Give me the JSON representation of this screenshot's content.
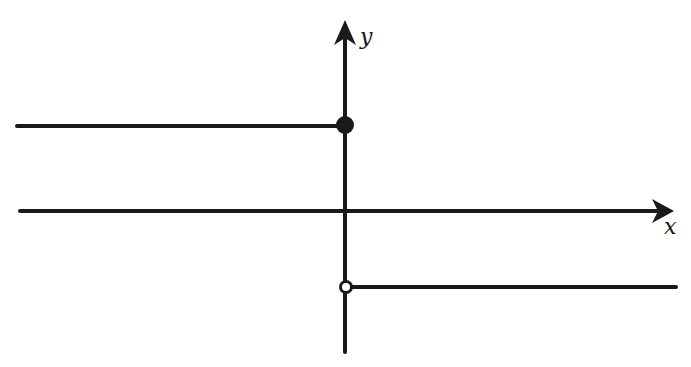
{
  "diagram": {
    "type": "step-function-graph",
    "colors": {
      "ink": "#1a1a1a",
      "background": "#ffffff"
    },
    "axes": {
      "x": {
        "label": "x",
        "y_px": 211,
        "from_px": 20,
        "to_px": 670
      },
      "y": {
        "label": "y",
        "x_px": 345,
        "from_px": 352,
        "to_px": 22
      }
    },
    "segments": [
      {
        "name": "upper-ray",
        "description": "horizontal ray to the left at positive y",
        "x1": 17,
        "y1": 126,
        "x2": 345,
        "y2": 126
      },
      {
        "name": "lower-ray",
        "description": "horizontal ray to the right at negative y",
        "x1": 345,
        "y1": 287,
        "x2": 676,
        "y2": 287
      }
    ],
    "points": [
      {
        "name": "closed-endpoint",
        "filled": true,
        "x": 345,
        "y": 125
      },
      {
        "name": "open-endpoint",
        "filled": false,
        "x": 346,
        "y": 287
      }
    ]
  }
}
